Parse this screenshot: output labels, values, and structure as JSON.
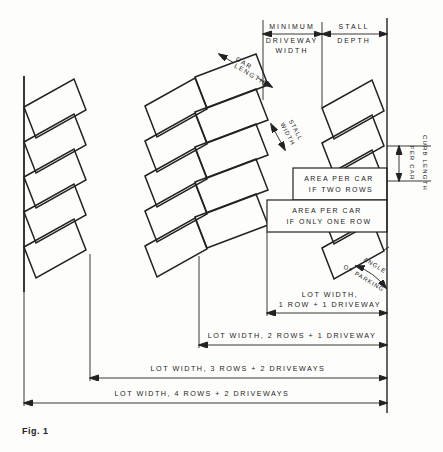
{
  "figure": {
    "caption": "Fig. 1"
  },
  "colors": {
    "ink": "#222222",
    "paper": "#fdfdfb"
  },
  "labels": {
    "minimum": "MINIMUM",
    "driveway": "DRIVEWAY",
    "width": "WIDTH",
    "stall": "STALL",
    "depth": "DEPTH",
    "car": "CAR",
    "length": "LENGTH",
    "curb_length": "CURB LENGTH",
    "per_car": "PER CAR",
    "area_per_car": "AREA PER CAR",
    "if_two_rows": "IF TWO ROWS",
    "if_only_one_row": "IF ONLY ONE ROW",
    "angle": "ANGLE",
    "of_parking": "OF PARKING",
    "lot_width_comma": "LOT WIDTH,",
    "one_row_one_driveway": "1 ROW + 1 DRIVEWAY",
    "lot2": "LOT WIDTH, 2 ROWS + 1 DRIVEWAY",
    "lot3": "LOT WIDTH, 3 ROWS + 2 DRIVEWAYS",
    "lot4": "LOT WIDTH, 4 ROWS + 2 DRIVEWAYS",
    "fig": "Fig. 1"
  },
  "diagram": {
    "stall_rows": [
      {
        "name": "row-1-curbside-left",
        "base": [
          24,
          107
        ],
        "step": [
          0,
          35
        ],
        "count": 5,
        "L": [
          50,
          -28
        ],
        "W": [
          12,
          31
        ]
      },
      {
        "name": "row-2-middle-left",
        "base": [
          145,
          106
        ],
        "step": [
          0,
          35
        ],
        "count": 5,
        "L": [
          50,
          -28
        ],
        "W": [
          12,
          31
        ]
      },
      {
        "name": "row-3-middle-right",
        "base": [
          195,
          77
        ],
        "step": [
          0,
          35
        ],
        "count": 5,
        "L": [
          61,
          -23
        ],
        "W": [
          12,
          31
        ]
      },
      {
        "name": "row-4-curbside-right",
        "base": [
          322,
          108
        ],
        "step": [
          0,
          35
        ],
        "count": 5,
        "L": [
          50,
          -28
        ],
        "W": [
          12,
          31
        ]
      }
    ],
    "area_rects": [
      {
        "name": "area-per-car-two-rows-box",
        "x": 293,
        "y": 168,
        "w": 94,
        "h": 32
      },
      {
        "name": "area-per-car-one-row-box",
        "x": 267,
        "y": 200,
        "w": 120,
        "h": 32
      }
    ],
    "lines": [
      {
        "name": "left-curb",
        "x1": 24,
        "y1": 76,
        "x2": 24,
        "y2": 292,
        "c": "curb"
      },
      {
        "name": "left-curb-extension",
        "x1": 24,
        "y1": 292,
        "x2": 24,
        "y2": 406,
        "c": "ext"
      },
      {
        "name": "right-curb",
        "x1": 387,
        "y1": 18,
        "x2": 387,
        "y2": 413,
        "c": "curb2"
      },
      {
        "name": "ext-driveway-left",
        "x1": 263,
        "y1": 20,
        "x2": 263,
        "y2": 100,
        "c": "ext"
      },
      {
        "name": "ext-stall-depth-left",
        "x1": 322,
        "y1": 22,
        "x2": 322,
        "y2": 107,
        "c": "ext"
      },
      {
        "name": "dim-min-driveway-width",
        "x1": 263,
        "y1": 34,
        "x2": 322,
        "y2": 34,
        "c": "dim",
        "arr": "both"
      },
      {
        "name": "dim-stall-depth",
        "x1": 322,
        "y1": 34,
        "x2": 387,
        "y2": 34,
        "c": "dim",
        "arr": "both"
      },
      {
        "name": "dim-car-length-a",
        "x1": 219,
        "y1": 54,
        "x2": 234,
        "y2": 63,
        "c": "dim",
        "arr": "start"
      },
      {
        "name": "dim-car-length-b",
        "x1": 258,
        "y1": 78,
        "x2": 272,
        "y2": 87,
        "c": "dim",
        "arr": "end"
      },
      {
        "name": "dim-stall-width",
        "x1": 271,
        "y1": 124,
        "x2": 285,
        "y2": 150,
        "c": "dim",
        "arr": "both"
      },
      {
        "name": "curb-length-tick-top",
        "x1": 387,
        "y1": 146,
        "x2": 431,
        "y2": 146,
        "c": "ext"
      },
      {
        "name": "curb-length-tick-bottom",
        "x1": 387,
        "y1": 181,
        "x2": 431,
        "y2": 181,
        "c": "ext"
      },
      {
        "name": "dim-curb-length",
        "x1": 399,
        "y1": 146,
        "x2": 399,
        "y2": 181,
        "c": "dim",
        "arr": "both"
      },
      {
        "name": "ext-one-row",
        "x1": 267,
        "y1": 232,
        "x2": 267,
        "y2": 316,
        "c": "ext"
      },
      {
        "name": "ext-two-rows",
        "x1": 199,
        "y1": 256,
        "x2": 199,
        "y2": 348,
        "c": "ext"
      },
      {
        "name": "ext-three-rows",
        "x1": 90,
        "y1": 254,
        "x2": 90,
        "y2": 381,
        "c": "ext"
      },
      {
        "name": "dim-lot-1",
        "x1": 267,
        "y1": 313,
        "x2": 387,
        "y2": 313,
        "c": "dim",
        "arr": "both"
      },
      {
        "name": "dim-lot-2",
        "x1": 199,
        "y1": 345,
        "x2": 387,
        "y2": 345,
        "c": "dim",
        "arr": "both"
      },
      {
        "name": "dim-lot-3",
        "x1": 90,
        "y1": 378,
        "x2": 387,
        "y2": 378,
        "c": "dim",
        "arr": "both"
      },
      {
        "name": "dim-lot-4",
        "x1": 24,
        "y1": 403,
        "x2": 387,
        "y2": 403,
        "c": "dim",
        "arr": "both"
      },
      {
        "name": "angle-edge-extension",
        "x1": 384,
        "y1": 250,
        "x2": 389,
        "y2": 247,
        "c": "ext"
      }
    ],
    "arcs": [
      {
        "name": "angle-of-parking-arc",
        "d": "M 356 266 Q 374 272 386 288",
        "arr": "both"
      }
    ],
    "texts": [
      {
        "k": "minimum",
        "x": 292,
        "y": 29,
        "s": 7,
        "ls": 2
      },
      {
        "k": "driveway",
        "x": 292,
        "y": 43,
        "s": 7,
        "ls": 2
      },
      {
        "k": "width",
        "x": 292,
        "y": 53,
        "s": 7,
        "ls": 2
      },
      {
        "k": "stall",
        "x": 354,
        "y": 29,
        "s": 7,
        "ls": 2
      },
      {
        "k": "depth",
        "x": 354,
        "y": 43,
        "s": 7,
        "ls": 2
      },
      {
        "k": "car",
        "x": 243,
        "y": 65,
        "s": 6.5,
        "ls": 1.5,
        "r": 31
      },
      {
        "k": "length",
        "x": 249,
        "y": 76,
        "s": 6.5,
        "ls": 1.5,
        "r": 31
      },
      {
        "k": "stall",
        "x": 294,
        "y": 131,
        "s": 6,
        "ls": 1,
        "r": 62
      },
      {
        "k": "width",
        "x": 286,
        "y": 135,
        "s": 6,
        "ls": 1,
        "r": 62
      },
      {
        "k": "curb_length",
        "x": 423,
        "y": 163,
        "s": 6,
        "ls": 1.2,
        "r": 90
      },
      {
        "k": "per_car",
        "x": 410,
        "y": 163,
        "s": 6,
        "ls": 1.2,
        "r": 90
      },
      {
        "k": "area_per_car",
        "x": 339,
        "y": 181,
        "s": 7,
        "ls": 1.5
      },
      {
        "k": "if_two_rows",
        "x": 341,
        "y": 192,
        "s": 7,
        "ls": 1.5
      },
      {
        "k": "area_per_car",
        "x": 327,
        "y": 213,
        "s": 7,
        "ls": 1.5
      },
      {
        "k": "if_only_one_row",
        "x": 329,
        "y": 224,
        "s": 7,
        "ls": 1.5
      },
      {
        "k": "angle",
        "x": 374,
        "y": 267,
        "s": 6,
        "ls": 1,
        "r": 31
      },
      {
        "k": "of_parking",
        "x": 363,
        "y": 280,
        "s": 6,
        "ls": 1,
        "r": 31
      },
      {
        "k": "lot_width_comma",
        "x": 330,
        "y": 297,
        "s": 7.2,
        "ls": 1.5
      },
      {
        "k": "one_row_one_driveway",
        "x": 330,
        "y": 307,
        "s": 7.2,
        "ls": 1.5
      },
      {
        "k": "lot2",
        "x": 292,
        "y": 338,
        "s": 7.2,
        "ls": 1.5
      },
      {
        "k": "lot3",
        "x": 238,
        "y": 371,
        "s": 7.2,
        "ls": 1.5
      },
      {
        "k": "lot4",
        "x": 202,
        "y": 396,
        "s": 7.2,
        "ls": 1.5
      },
      {
        "k": "fig",
        "x": 22,
        "y": 434,
        "s": 9,
        "ls": 0.5,
        "w": 700,
        "anchor": "start"
      }
    ]
  }
}
